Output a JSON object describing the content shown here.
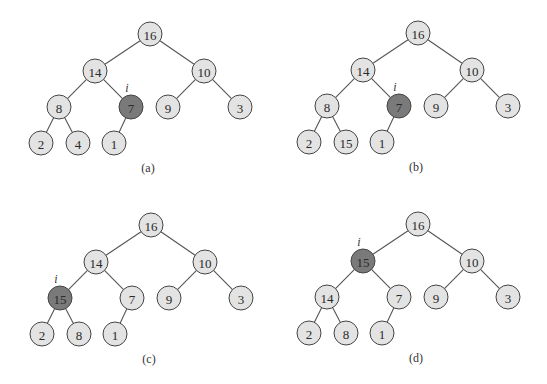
{
  "figure": {
    "colors": {
      "node_fill": "#e3e3e3",
      "highlight_fill": "#7a7a7a",
      "edge": "#555555",
      "node_stroke": "#444444"
    },
    "node_radius": 12,
    "marker_label": "i",
    "panels": [
      {
        "caption": "(a)",
        "offset": [
          0,
          0
        ],
        "highlight_index": 4,
        "values": [
          "16",
          "14",
          "10",
          "8",
          "7",
          "9",
          "3",
          "2",
          "4",
          "1"
        ]
      },
      {
        "caption": "(b)",
        "offset": [
          268,
          -1
        ],
        "highlight_index": 4,
        "values": [
          "16",
          "14",
          "10",
          "8",
          "7",
          "9",
          "3",
          "2",
          "15",
          "1"
        ]
      },
      {
        "caption": "(c)",
        "offset": [
          1,
          191
        ],
        "highlight_index": 3,
        "values": [
          "16",
          "14",
          "10",
          "15",
          "7",
          "9",
          "3",
          "2",
          "8",
          "1"
        ]
      },
      {
        "caption": "(d)",
        "offset": [
          268,
          190
        ],
        "highlight_index": 1,
        "values": [
          "16",
          "15",
          "10",
          "14",
          "7",
          "9",
          "3",
          "2",
          "8",
          "1"
        ]
      }
    ]
  }
}
